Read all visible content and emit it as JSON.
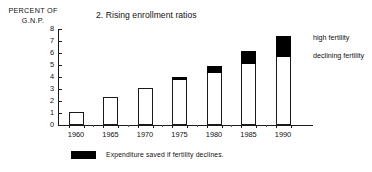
{
  "chart_data": {
    "type": "bar",
    "title": "2. Rising enrollment ratios",
    "ylabel_line1": "PERCENT OF",
    "ylabel_line2": "G.N.P.",
    "xlabel": "",
    "categories": [
      "1960",
      "1965",
      "1970",
      "1975",
      "1980",
      "1985",
      "1990"
    ],
    "ylim": [
      0,
      8
    ],
    "yticks": [
      0,
      1,
      2,
      3,
      4,
      5,
      6,
      7,
      8
    ],
    "ytick_labels": [
      "0",
      "1",
      "2",
      "3",
      "4",
      "5",
      "6",
      "7",
      "8"
    ],
    "grid": false,
    "legend_position": "right",
    "series": [
      {
        "name": "declining fertility",
        "color": "#ffffff",
        "values": [
          1.05,
          2.35,
          3.1,
          3.8,
          4.45,
          5.15,
          5.75
        ]
      },
      {
        "name": "high fertility",
        "color": "#000000",
        "values": [
          0,
          0,
          0,
          0.2,
          0.45,
          1.0,
          1.7
        ]
      }
    ],
    "totals": [
      1.05,
      2.35,
      3.1,
      4.0,
      4.9,
      6.15,
      7.45
    ],
    "annotations": [
      "Expenditure saved if fertility declines."
    ]
  },
  "legend": {
    "high_fertility": "high fertility",
    "declining_fertility": "declining fertility",
    "footnote": "Expenditure saved if fertility declines."
  }
}
